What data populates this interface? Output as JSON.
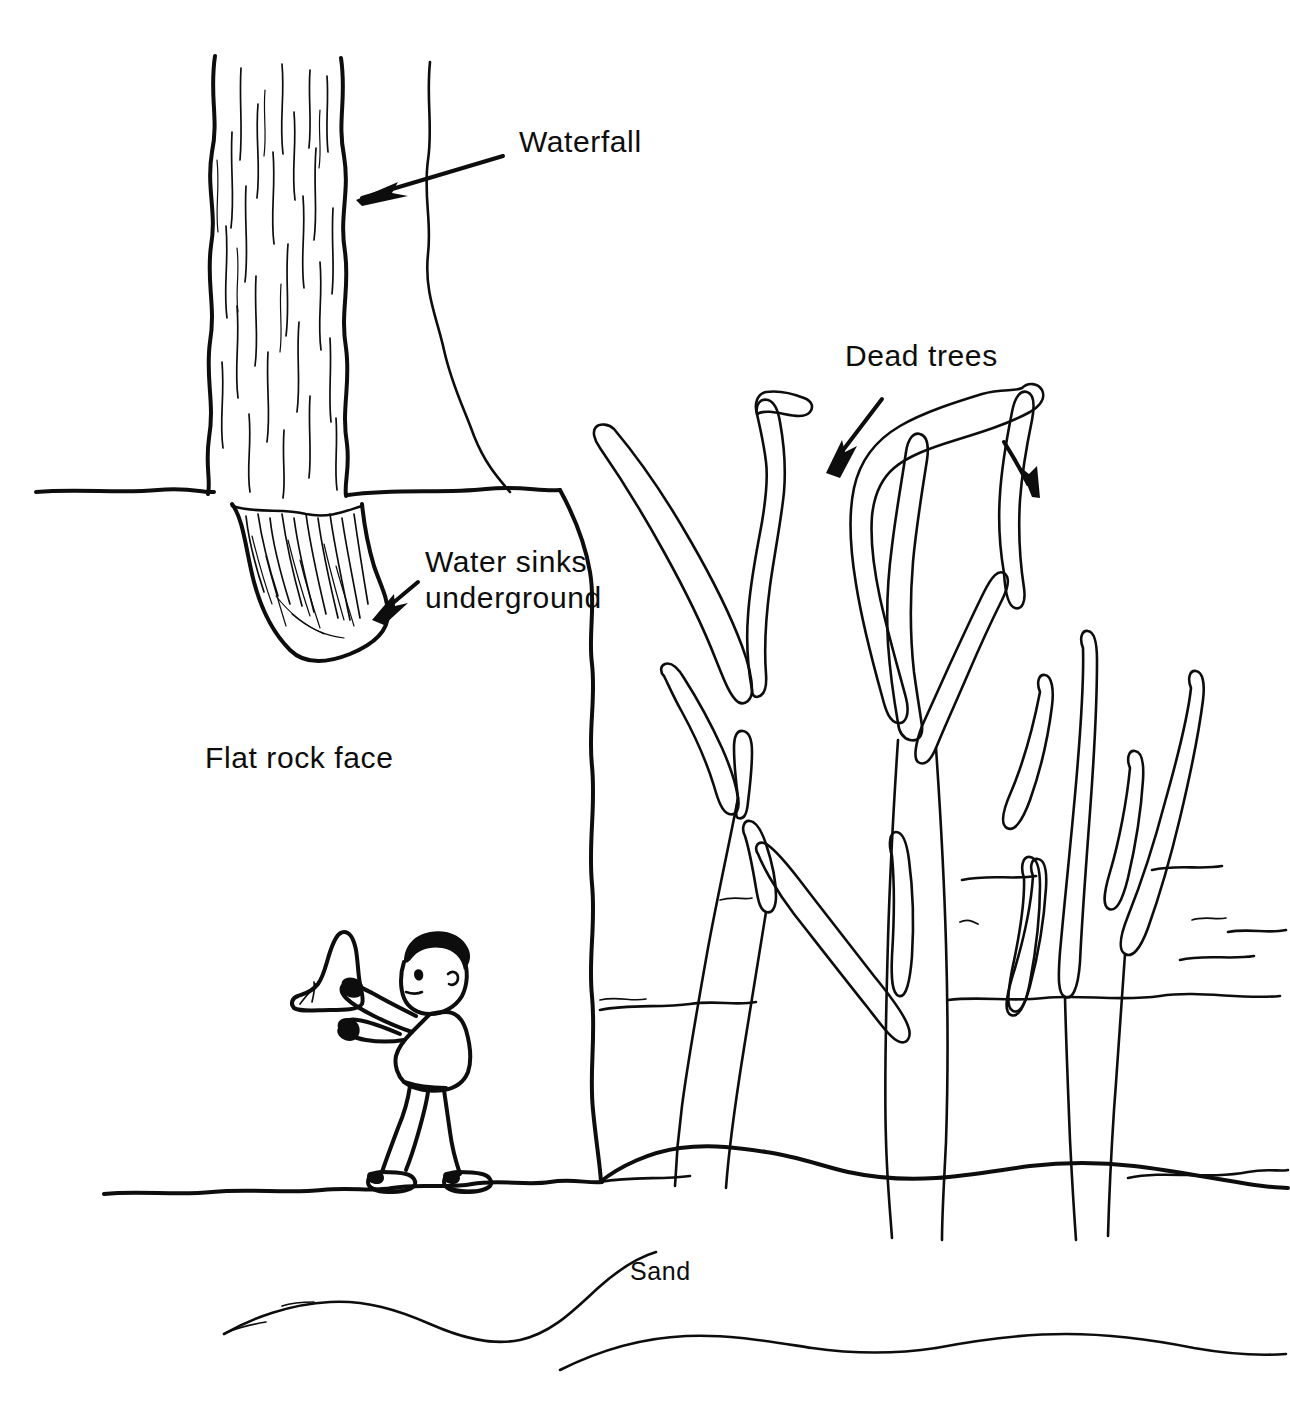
{
  "illustration": {
    "title": "Desert waterfall and dead trees scene",
    "style": "black ink line drawing on white background",
    "background_color": "#ffffff",
    "ink_color": "#0d0d0d"
  },
  "labels": [
    {
      "id": "waterfall",
      "text": "Waterfall",
      "x": 520,
      "y": 152,
      "anchor": "start",
      "size": "normal",
      "has_arrow": true,
      "arrow_points_to": "falling water column"
    },
    {
      "id": "water-sinks",
      "line1": "Water sinks",
      "line2": "underground",
      "x": 425,
      "y": 572,
      "anchor": "start",
      "size": "normal",
      "has_arrow": true,
      "arrow_points_to": "pool at base of waterfall"
    },
    {
      "id": "flat-rock-face",
      "text": "Flat rock face",
      "x": 205,
      "y": 768,
      "anchor": "start",
      "size": "normal",
      "has_arrow": false
    },
    {
      "id": "dead-trees",
      "text": "Dead trees",
      "x": 845,
      "y": 366,
      "anchor": "start",
      "size": "normal",
      "has_arrow": true,
      "arrow_count": 2,
      "arrow_points_to": "bare tree branches"
    },
    {
      "id": "sand",
      "text": "Sand",
      "x": 630,
      "y": 1280,
      "anchor": "start",
      "size": "small",
      "has_arrow": false
    }
  ],
  "scene_elements": [
    {
      "name": "waterfall",
      "description": "vertical column of falling water with streak lines, upper left"
    },
    {
      "name": "cliff-top-edge",
      "description": "horizontal ground line at top of cliff, left side"
    },
    {
      "name": "water-pool",
      "description": "hatched pool where water sinks underground at cliff base"
    },
    {
      "name": "rock-face",
      "description": "large flat vertical rock wall below the cliff"
    },
    {
      "name": "person",
      "description": "figure walking right carrying a rock"
    },
    {
      "name": "dead-tree-left",
      "description": "bare forked tree, left of grove"
    },
    {
      "name": "dead-tree-center",
      "description": "large bare tree with thick curving branches"
    },
    {
      "name": "dead-tree-right",
      "description": "slender bare forked tree at far right"
    },
    {
      "name": "dunes",
      "description": "undulating sand dune contour lines across middle and foreground"
    },
    {
      "name": "ground-line",
      "description": "sand surface line the person walks on"
    }
  ]
}
